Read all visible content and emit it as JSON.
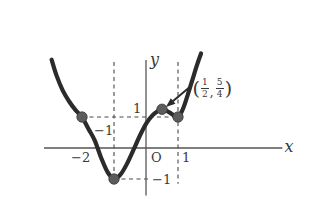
{
  "chart_data": {
    "type": "line",
    "title": "",
    "xlabel": "x",
    "ylabel": "y",
    "grid": false,
    "legend": null,
    "xlim": [
      -3.0,
      4.2
    ],
    "ylim": [
      -1.6,
      2.9
    ],
    "origin_label": "O",
    "x_ticks": [
      {
        "value": -2,
        "label": "−2"
      },
      {
        "value": 1,
        "label": "1"
      }
    ],
    "y_ticks": [
      {
        "value": 1,
        "label": "1"
      },
      {
        "value": -1,
        "label": "−1"
      }
    ],
    "extra_labels": [
      {
        "text": "−1",
        "x": -1,
        "y": 0.55,
        "note": "x = -1 tick label placed above axis"
      }
    ],
    "curve": {
      "name": "cubic",
      "description": "cubic passing through (-2,1), local min (-1,-1), (0.5,1.25), (1,1) then rising",
      "points": [
        [
          -2.95,
          2.85
        ],
        [
          -2.8,
          2.35
        ],
        [
          -2.6,
          1.85
        ],
        [
          -2.4,
          1.5
        ],
        [
          -2.2,
          1.22
        ],
        [
          -2.0,
          1.0
        ],
        [
          -1.8,
          0.62
        ],
        [
          -1.6,
          0.24
        ],
        [
          -1.4,
          -0.32
        ],
        [
          -1.2,
          -0.78
        ],
        [
          -1.0,
          -1.0
        ],
        [
          -0.8,
          -0.86
        ],
        [
          -0.6,
          -0.52
        ],
        [
          -0.4,
          -0.08
        ],
        [
          -0.2,
          0.38
        ],
        [
          0.0,
          0.78
        ],
        [
          0.2,
          1.05
        ],
        [
          0.35,
          1.18
        ],
        [
          0.5,
          1.25
        ],
        [
          0.65,
          1.2
        ],
        [
          0.8,
          1.1
        ],
        [
          1.0,
          1.0
        ],
        [
          1.15,
          1.25
        ],
        [
          1.3,
          1.7
        ],
        [
          1.45,
          2.2
        ],
        [
          1.6,
          2.7
        ],
        [
          1.72,
          3.05
        ]
      ]
    },
    "marked_points": [
      {
        "x": -2,
        "y": 1,
        "label": ""
      },
      {
        "x": -1,
        "y": -1,
        "label": ""
      },
      {
        "x": 0.5,
        "y": 1.25,
        "label": "(1/2, 5/4)"
      },
      {
        "x": 1,
        "y": 1,
        "label": ""
      }
    ],
    "dashed_vertical_lines": [
      -1,
      1
    ],
    "dashed_horizontal_lines": [
      1,
      -1
    ],
    "annotation": {
      "text_numerator_x": "1",
      "text_denominator_x": "2",
      "text_numerator_y": "5",
      "text_denominator_y": "4",
      "open_paren": "(",
      "close_paren": ")",
      "comma": ",",
      "arrow_from": [
        1.35,
        1.95
      ],
      "arrow_to": [
        0.62,
        1.32
      ]
    },
    "colors": {
      "curve": "#2b2b2b",
      "axis": "#555555",
      "dashed": "#4a4a4a",
      "point": "#5c5c5c",
      "text": "#3a3a3a",
      "background": "#ffffff"
    }
  },
  "labels": {
    "x_axis": "x",
    "y_axis": "y",
    "origin": "O",
    "tick_neg2": "−2",
    "tick_pos1_x": "1",
    "tick_pos1_y": "1",
    "tick_neg1_x": "−1",
    "tick_neg1_y": "−1"
  }
}
